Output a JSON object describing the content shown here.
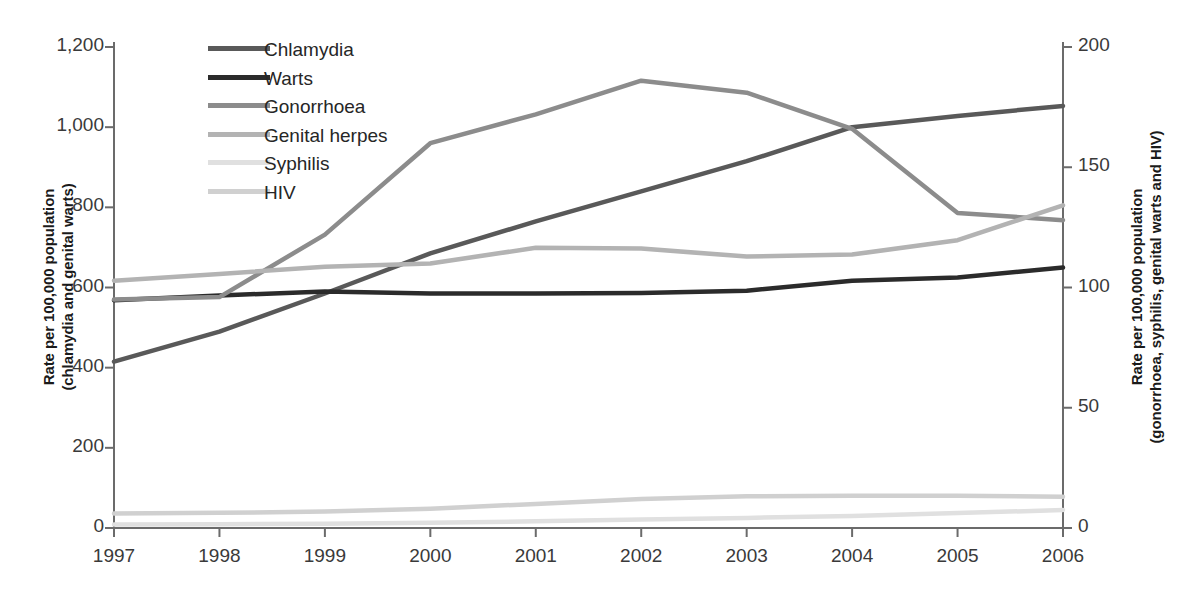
{
  "chart_data": {
    "type": "line",
    "title": "",
    "xlabel": "",
    "ylabel": "Rate per 100,000 population (chlamydia and genital warts)",
    "y2label": "Rate per 100,000 population (gonorrhoea, syphilis, genital warts and HIV)",
    "x": [
      "1997",
      "1998",
      "1999",
      "2000",
      "2001",
      "2002",
      "2003",
      "2004",
      "2005",
      "2006"
    ],
    "categories": [
      "1997",
      "1998",
      "1999",
      "2000",
      "2001",
      "2002",
      "2003",
      "2004",
      "2005",
      "2006"
    ],
    "ylim": [
      0,
      1200
    ],
    "y2lim": [
      0,
      200
    ],
    "yticks": [
      "0",
      "200",
      "400",
      "600",
      "800",
      "1,000",
      "1,200"
    ],
    "ytick_values": [
      0,
      200,
      400,
      600,
      800,
      1000,
      1200
    ],
    "y2ticks": [
      "0",
      "50",
      "100",
      "150",
      "200"
    ],
    "y2tick_values": [
      0,
      50,
      100,
      150,
      200
    ],
    "grid": false,
    "legend_position": "top-left",
    "series": [
      {
        "name": "Chlamydia",
        "axis": "left",
        "color": "#595959",
        "values": [
          415,
          490,
          585,
          685,
          765,
          840,
          915,
          1000,
          1028,
          1053
        ]
      },
      {
        "name": "Warts",
        "axis": "left",
        "color": "#2b2b2b",
        "values": [
          568,
          580,
          590,
          585,
          585,
          586,
          592,
          617,
          625,
          650
        ]
      },
      {
        "name": "Gonorrhoea",
        "axis": "right",
        "color": "#8c8c8c",
        "values": [
          95,
          96,
          122,
          160,
          172,
          186,
          181,
          166,
          131,
          128
        ]
      },
      {
        "name": "Genital herpes",
        "axis": "left",
        "color": "#b3b3b3",
        "values": [
          617,
          634,
          652,
          660,
          699,
          697,
          677,
          682,
          718,
          805
        ]
      },
      {
        "name": "Syphilis",
        "axis": "right",
        "color": "#e0e0e0",
        "values": [
          1.5,
          1.6,
          1.8,
          2.2,
          2.8,
          3.5,
          4.2,
          5.0,
          6.2,
          7.5
        ]
      },
      {
        "name": "HIV",
        "axis": "right",
        "color": "#d0d0d0",
        "values": [
          6.0,
          6.3,
          6.8,
          8.0,
          10.0,
          12.0,
          13.2,
          13.4,
          13.4,
          13.0
        ]
      }
    ]
  },
  "legend": {
    "items": [
      {
        "label": "Chlamydia"
      },
      {
        "label": "Warts"
      },
      {
        "label": "Gonorrhoea"
      },
      {
        "label": "Genital herpes"
      },
      {
        "label": "Syphilis"
      },
      {
        "label": "HIV"
      }
    ]
  },
  "axes": {
    "left_title": "Rate per 100,000 population (chlamydia and genital warts)",
    "left_title_line1": "Rate per 100,000 population",
    "left_title_line2": "(chlamydia and genital warts)",
    "right_title_line1": "Rate per 100,000 population",
    "right_title_line2": "(gonorrhoea, syphilis, genital warts and HIV)"
  }
}
